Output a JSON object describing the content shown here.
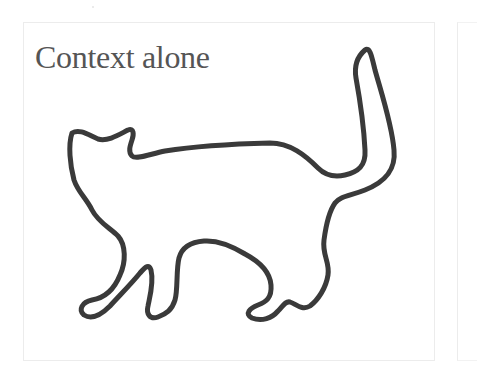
{
  "panel": {
    "title": "Context alone",
    "title_color": "#555555",
    "border_color": "#ececec",
    "figure": {
      "subject": "cat-outline",
      "stroke_color": "#3a3a3a",
      "fill": "none"
    }
  },
  "next_panel": {
    "partially_visible": true
  }
}
